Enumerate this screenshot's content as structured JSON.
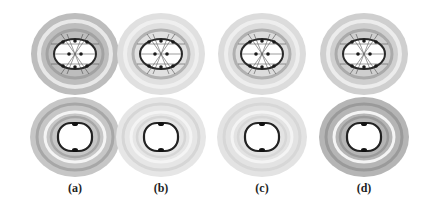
{
  "figure": {
    "panels": [
      {
        "id": "a",
        "label": "(a)",
        "cx": 75,
        "top_tone": "#bdbdbd",
        "bottom_tone": "#c6c6c6",
        "bottom_ring": "#9a9a9a"
      },
      {
        "id": "b",
        "label": "(b)",
        "cx": 161,
        "top_tone": "#e0e0e0",
        "bottom_tone": "#e6e6e6",
        "bottom_ring": "#cfcfcf"
      },
      {
        "id": "c",
        "label": "(c)",
        "cx": 262,
        "top_tone": "#dcdcdc",
        "bottom_tone": "#e3e3e3",
        "bottom_ring": "#d2d2d2"
      },
      {
        "id": "d",
        "label": "(d)",
        "cx": 364,
        "top_tone": "#cfcfcf",
        "bottom_tone": "#b5b5b5",
        "bottom_ring": "#8e8e8e"
      }
    ]
  }
}
